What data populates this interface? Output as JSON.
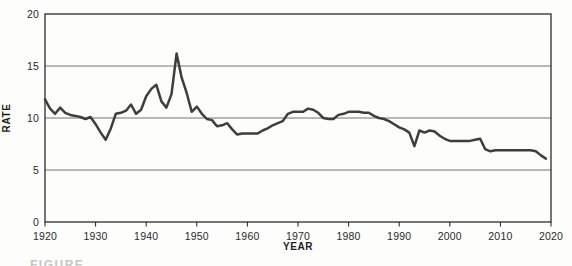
{
  "figure": {
    "caption": "FIGURE"
  },
  "chart_data": {
    "type": "line",
    "title": "",
    "xlabel": "YEAR",
    "ylabel": "RATE",
    "xlim": [
      1920,
      2020
    ],
    "ylim": [
      0,
      20
    ],
    "xticks": [
      1920,
      1930,
      1940,
      1950,
      1960,
      1970,
      1980,
      1990,
      2000,
      2010,
      2020
    ],
    "yticks": [
      0,
      5,
      10,
      15,
      20
    ],
    "grid": "horizontal-gridlines-at-5-10-15",
    "legend": "none",
    "series": [
      {
        "name": "rate",
        "x": [
          1920,
          1921,
          1922,
          1923,
          1924,
          1925,
          1926,
          1927,
          1928,
          1929,
          1930,
          1931,
          1932,
          1933,
          1934,
          1935,
          1936,
          1937,
          1938,
          1939,
          1940,
          1941,
          1942,
          1943,
          1944,
          1945,
          1946,
          1947,
          1948,
          1949,
          1950,
          1951,
          1952,
          1953,
          1954,
          1955,
          1956,
          1957,
          1958,
          1959,
          1960,
          1961,
          1962,
          1963,
          1964,
          1965,
          1966,
          1967,
          1968,
          1969,
          1970,
          1971,
          1972,
          1973,
          1974,
          1975,
          1976,
          1977,
          1978,
          1979,
          1980,
          1981,
          1982,
          1983,
          1984,
          1985,
          1986,
          1987,
          1988,
          1989,
          1990,
          1991,
          1992,
          1993,
          1994,
          1995,
          1996,
          1997,
          1998,
          1999,
          2000,
          2001,
          2002,
          2003,
          2004,
          2005,
          2006,
          2007,
          2008,
          2009,
          2010,
          2011,
          2012,
          2013,
          2014,
          2015,
          2016,
          2017,
          2018,
          2019
        ],
        "values": [
          11.8,
          10.9,
          10.4,
          11.0,
          10.5,
          10.3,
          10.2,
          10.1,
          9.9,
          10.1,
          9.4,
          8.6,
          7.9,
          9.0,
          10.4,
          10.5,
          10.7,
          11.3,
          10.4,
          10.8,
          12.1,
          12.8,
          13.2,
          11.6,
          11.0,
          12.3,
          16.2,
          13.9,
          12.4,
          10.6,
          11.1,
          10.4,
          9.9,
          9.8,
          9.2,
          9.3,
          9.5,
          8.9,
          8.4,
          8.5,
          8.5,
          8.5,
          8.5,
          8.8,
          9.0,
          9.3,
          9.5,
          9.7,
          10.4,
          10.6,
          10.6,
          10.6,
          10.9,
          10.8,
          10.5,
          10.0,
          9.9,
          9.9,
          10.3,
          10.4,
          10.6,
          10.6,
          10.6,
          10.5,
          10.5,
          10.2,
          10.0,
          9.9,
          9.7,
          9.4,
          9.1,
          8.9,
          8.6,
          7.3,
          8.8,
          8.6,
          8.8,
          8.7,
          8.3,
          8.0,
          7.8,
          7.8,
          7.8,
          7.8,
          7.8,
          7.9,
          8.0,
          7.0,
          6.8,
          6.9,
          6.9,
          6.9,
          6.9,
          6.9,
          6.9,
          6.9,
          6.9,
          6.8,
          6.4,
          6.1
        ]
      }
    ],
    "colors": {
      "line": "#3e3e3e",
      "axis": "#1c1c1c",
      "grid": "#4f4f4f",
      "text": "#2a2a2a",
      "background": "#fdfdfc",
      "caption": "#c6c6c3"
    }
  }
}
